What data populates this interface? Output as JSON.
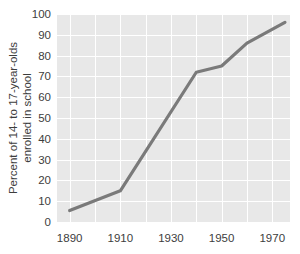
{
  "chart_data": {
    "type": "line",
    "title": "",
    "subtitle": "",
    "xlabel": "",
    "ylabel": "Percent of 14- to 17-year-olds enrolled in school",
    "ylabel_line1": "Percent of 14- to 17-year-olds",
    "ylabel_line2": "enrolled in school",
    "xlim": [
      1885,
      1977
    ],
    "ylim": [
      0,
      100
    ],
    "grid": true,
    "legend": "none",
    "x_ticks": [
      1890,
      1910,
      1930,
      1950,
      1970
    ],
    "x_tick_labels": [
      "1890",
      "1910",
      "1930",
      "1950",
      "1970"
    ],
    "y_ticks": [
      0,
      10,
      20,
      30,
      40,
      50,
      60,
      70,
      80,
      90,
      100
    ],
    "y_tick_labels": [
      "0",
      "10",
      "20",
      "30",
      "40",
      "50",
      "60",
      "70",
      "80",
      "90",
      "100"
    ],
    "x_gridlines": [
      1890,
      1900,
      1910,
      1920,
      1930,
      1940,
      1950,
      1960,
      1970
    ],
    "y_gridlines": [
      0,
      10,
      20,
      30,
      40,
      50,
      60,
      70,
      80,
      90,
      100
    ],
    "series": [
      {
        "name": "Percent enrolled",
        "x": [
          1890,
          1910,
          1940,
          1950,
          1960,
          1975
        ],
        "values": [
          5.5,
          15,
          72,
          75,
          86,
          96
        ]
      }
    ],
    "colors": {
      "line": "#7a7a7a",
      "plot_background": "#e8e8e8",
      "gridline": "#ffffff",
      "text": "#3d3d3d",
      "page_background": "#ffffff"
    }
  }
}
